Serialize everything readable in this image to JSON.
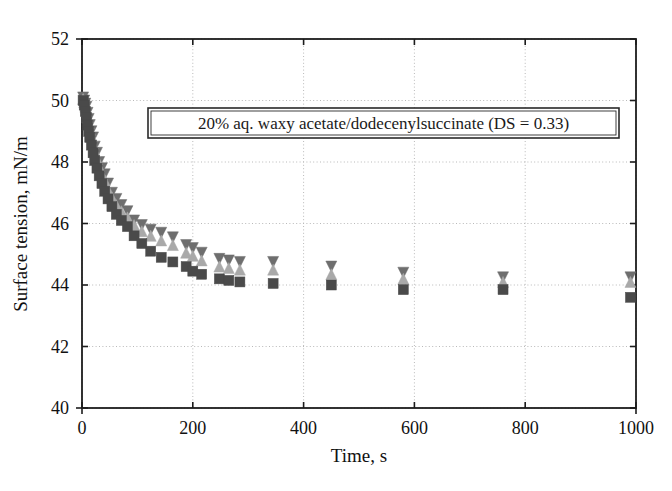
{
  "figure": {
    "background_color": "#ffffff",
    "frame_color": "#1c1c1c",
    "grid_color": "#b9b9b9"
  },
  "annotation": {
    "text": "20% aq. waxy acetate/dodecenylsuccinate (DS = 0.33)",
    "box_border_color": "#2a2a2a"
  },
  "chart_data": {
    "type": "scatter",
    "title": "",
    "subtitle": "",
    "xlabel": "Time, s",
    "ylabel": "Surface tension, mN/m",
    "xlim": [
      0,
      1000
    ],
    "ylim": [
      40,
      52
    ],
    "xticks": [
      0,
      200,
      400,
      600,
      800,
      1000
    ],
    "yticks": [
      40,
      42,
      44,
      46,
      48,
      50,
      52
    ],
    "xtick_labels": [
      "0",
      "200",
      "400",
      "600",
      "800",
      "1000"
    ],
    "ytick_labels": [
      "40",
      "42",
      "44",
      "46",
      "48",
      "50",
      "52"
    ],
    "grid": true,
    "grid_style": "dotted",
    "legend": "none",
    "annotations": [
      {
        "text": "20% aq. waxy acetate/dodecenylsuccinate (DS = 0.33)",
        "x_data": 120,
        "y_data": 48.9,
        "boxed": true
      }
    ],
    "series": [
      {
        "name": "run-1",
        "marker": "triangle-down",
        "color": "#6e6e6e",
        "size": 11,
        "x": [
          2,
          4,
          6,
          8,
          10,
          12,
          14,
          17,
          20,
          23,
          27,
          31,
          36,
          41,
          47,
          54,
          62,
          71,
          82,
          94,
          108,
          124,
          143,
          164,
          188,
          200,
          216,
          248,
          265,
          285,
          345,
          450,
          580,
          760,
          990
        ],
        "y": [
          50.1,
          50.0,
          49.9,
          49.8,
          49.6,
          49.4,
          49.2,
          49.0,
          48.8,
          48.5,
          48.3,
          48.0,
          47.8,
          47.6,
          47.3,
          47.0,
          46.8,
          46.6,
          46.4,
          46.1,
          45.95,
          45.8,
          45.7,
          45.55,
          45.3,
          45.2,
          45.05,
          44.85,
          44.8,
          44.75,
          44.75,
          44.6,
          44.4,
          44.25,
          44.25
        ]
      },
      {
        "name": "run-2",
        "marker": "triangle-up",
        "color": "#a9a9a9",
        "size": 11,
        "x": [
          2,
          4,
          6,
          8,
          10,
          12,
          14,
          17,
          20,
          23,
          27,
          31,
          36,
          41,
          47,
          54,
          62,
          71,
          82,
          94,
          108,
          124,
          143,
          164,
          188,
          200,
          216,
          248,
          265,
          285,
          345,
          450,
          580,
          760,
          990
        ],
        "y": [
          50.05,
          49.95,
          49.8,
          49.65,
          49.45,
          49.25,
          49.05,
          48.85,
          48.6,
          48.35,
          48.1,
          47.85,
          47.6,
          47.4,
          47.1,
          46.85,
          46.6,
          46.4,
          46.2,
          45.95,
          45.75,
          45.6,
          45.45,
          45.3,
          45.05,
          44.95,
          44.8,
          44.6,
          44.55,
          44.5,
          44.5,
          44.35,
          44.2,
          44.1,
          44.1
        ]
      },
      {
        "name": "run-3",
        "marker": "square",
        "color": "#4a4a4a",
        "size": 10,
        "x": [
          2,
          4,
          6,
          8,
          10,
          12,
          14,
          17,
          20,
          23,
          27,
          31,
          36,
          41,
          47,
          54,
          62,
          71,
          82,
          94,
          108,
          124,
          143,
          164,
          188,
          200,
          216,
          248,
          265,
          285,
          345,
          450,
          580,
          760,
          990
        ],
        "y": [
          50.0,
          49.85,
          49.65,
          49.45,
          49.2,
          49.0,
          48.8,
          48.55,
          48.3,
          48.05,
          47.8,
          47.55,
          47.3,
          47.05,
          46.8,
          46.55,
          46.3,
          46.1,
          45.9,
          45.6,
          45.35,
          45.1,
          44.9,
          44.75,
          44.6,
          44.45,
          44.35,
          44.2,
          44.15,
          44.1,
          44.05,
          44.0,
          43.85,
          43.85,
          43.6
        ]
      }
    ]
  }
}
